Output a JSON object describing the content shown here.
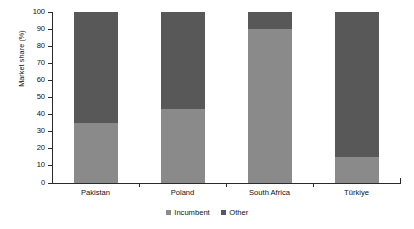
{
  "chart_data": {
    "type": "bar",
    "stacked": true,
    "title": "",
    "subtitle": "",
    "xlabel": "",
    "ylabel": "Market share (%)",
    "ylim": [
      0,
      100
    ],
    "ytick_values": [
      0,
      10,
      20,
      30,
      40,
      50,
      60,
      70,
      80,
      90,
      100
    ],
    "ytick_labels": [
      "0",
      "10",
      "20",
      "30",
      "40",
      "50",
      "60",
      "70",
      "80",
      "90",
      "100"
    ],
    "grid": false,
    "legend_position": "bottom-center",
    "categories": [
      "Pakistan",
      "Poland",
      "South Africa",
      "Türkiye"
    ],
    "series": [
      {
        "name": "Incumbent",
        "color": "#8a8a8a",
        "values": [
          35,
          43,
          90,
          15
        ]
      },
      {
        "name": "Other",
        "color": "#585858",
        "values": [
          65,
          57,
          10,
          85
        ]
      }
    ],
    "annotations": []
  },
  "legend": {
    "items": [
      {
        "label": "Incumbent",
        "color": "#8a8a8a"
      },
      {
        "label": "Other",
        "color": "#585858"
      }
    ]
  },
  "axis": {
    "y_title": "Market share (%)",
    "axis_color": "#2a2a2a"
  }
}
